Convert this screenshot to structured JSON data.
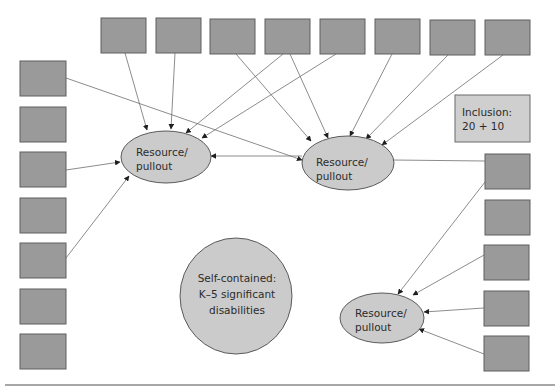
{
  "diagram": {
    "type": "service-model-network",
    "colors": {
      "student_box_fill": "#9a9a9a",
      "ellipse_fill": "#cbcbcb",
      "label_box_fill": "#cfcfcf",
      "line": "#6f6f6f",
      "text": "#2b2b2b"
    },
    "nodes": {
      "resource_1": {
        "line1": "Resource/",
        "line2": "pullout"
      },
      "resource_2": {
        "line1": "Resource/",
        "line2": "pullout"
      },
      "resource_3": {
        "line1": "Resource/",
        "line2": "pullout"
      },
      "self_contained": {
        "line1": "Self-contained:",
        "line2": "K–5 significant",
        "line3": "disabilities"
      },
      "inclusion": {
        "line1": "Inclusion:",
        "line2": "20 + 10"
      }
    },
    "student_boxes": {
      "top_row_count": 8,
      "left_column_count": 7,
      "right_column_count": 5
    },
    "edges": [
      {
        "from": "top-1",
        "to": "resource_1"
      },
      {
        "from": "top-2",
        "to": "resource_1"
      },
      {
        "from": "top-4",
        "to": "resource_1"
      },
      {
        "from": "top-5",
        "to": "resource_1"
      },
      {
        "from": "top-3",
        "to": "resource_2"
      },
      {
        "from": "top-4",
        "to": "resource_2"
      },
      {
        "from": "top-6",
        "to": "resource_2"
      },
      {
        "from": "top-7",
        "to": "resource_2"
      },
      {
        "from": "top-8",
        "to": "resource_2"
      },
      {
        "from": "left-1",
        "to": "resource_2"
      },
      {
        "from": "left-3",
        "to": "resource_1"
      },
      {
        "from": "left-5",
        "to": "resource_1"
      },
      {
        "from": "resource_2",
        "to": "resource_1"
      },
      {
        "from": "resource_2",
        "to": "right-1",
        "arrow": false
      },
      {
        "from": "right-1",
        "to": "resource_3"
      },
      {
        "from": "right-3",
        "to": "resource_3"
      },
      {
        "from": "right-4",
        "to": "resource_3"
      },
      {
        "from": "right-5",
        "to": "resource_3"
      }
    ]
  }
}
